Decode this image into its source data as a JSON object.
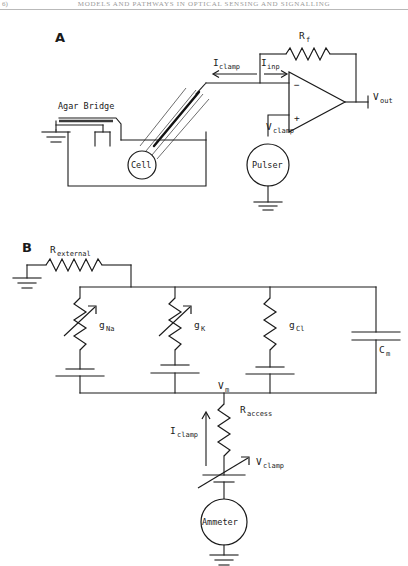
{
  "page": {
    "folio": "6)",
    "running_head": "MODELS AND PATHWAYS IN OPTICAL SENSING AND SIGNALLING",
    "figure_caption": ""
  },
  "panels": [
    {
      "id": "A",
      "letter": "A",
      "title": "Voltage clamp recording schematic",
      "labels": {
        "feedback_resistor": "R",
        "feedback_resistor_sub": "f",
        "clamp_current": "I",
        "clamp_current_sub": "clamp",
        "input_current": "I",
        "input_current_sub": "inp",
        "output_voltage": "V",
        "output_voltage_sub": "out",
        "clamp_voltage": "V",
        "clamp_voltage_sub": "clamp",
        "pulser": "Pulser",
        "agar_bridge": "Agar Bridge",
        "cell": "Cell",
        "opamp_minus": "−",
        "opamp_plus": "+"
      }
    },
    {
      "id": "B",
      "letter": "B",
      "title": "Equivalent electrical circuit model of the membrane",
      "labels": {
        "external_resistance": "R",
        "external_resistance_sub": "external",
        "sodium_conductance": "g",
        "sodium_conductance_sub": "Na",
        "potassium_conductance": "g",
        "potassium_conductance_sub": "K",
        "chloride_conductance": "g",
        "chloride_conductance_sub": "Cl",
        "membrane_capacitance": "C",
        "membrane_capacitance_sub": "m",
        "membrane_voltage": "V",
        "membrane_voltage_sub": "m",
        "access_resistance": "R",
        "access_resistance_sub": "access",
        "clamp_current": "I",
        "clamp_current_sub": "clamp",
        "clamp_voltage": "V",
        "clamp_voltage_sub": "clamp",
        "ammeter": "Ammeter"
      }
    }
  ],
  "colors": {
    "ink": "#1a1a1a",
    "background": "#ffffff",
    "header_text": "#9a9a9a",
    "rule": "#b9b9b9",
    "glass": "#6e6e6e"
  }
}
